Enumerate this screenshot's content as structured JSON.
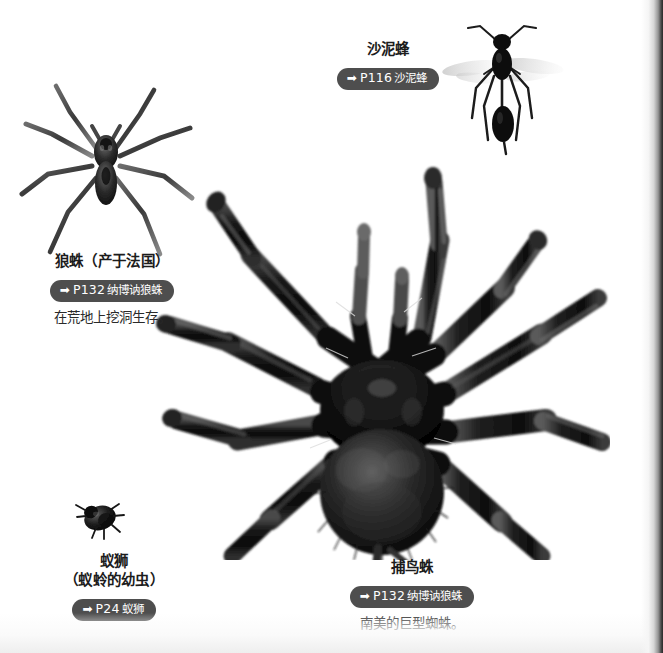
{
  "page": {
    "background_color": "#ffffff",
    "pill_color": "#4e4e4e",
    "pill_text_color": "#ffffff",
    "text_color": "#1c1c1c"
  },
  "captions": [
    {
      "id": "sand-wasp",
      "title": "沙泥蜂",
      "pill_arrow": "➡",
      "pill_ref": "P116",
      "pill_name": "沙泥蜂",
      "desc": ""
    },
    {
      "id": "wolf-spider",
      "title": "狼蛛（产于法国）",
      "pill_arrow": "➡",
      "pill_ref": "P132",
      "pill_name": "纳博讷狼蛛",
      "desc": "在荒地上挖洞生存。"
    },
    {
      "id": "antlion",
      "title": "蚁狮",
      "title2": "（蚁蛉的幼虫）",
      "pill_arrow": "➡",
      "pill_ref": "P24",
      "pill_name": "蚁狮",
      "desc": ""
    },
    {
      "id": "bird-eating-spider",
      "title": "捕鸟蛛",
      "pill_arrow": "➡",
      "pill_ref": "P132",
      "pill_name": "纳博讷狼蛛",
      "desc": "南美的巨型蜘蛛。"
    }
  ],
  "figures": [
    {
      "id": "wolf-spider-photo",
      "label": "wolf-spider-photo"
    },
    {
      "id": "sand-wasp-photo",
      "label": "sand-wasp-photo"
    },
    {
      "id": "antlion-photo",
      "label": "antlion-photo"
    },
    {
      "id": "tarantula-photo",
      "label": "tarantula-photo"
    }
  ]
}
